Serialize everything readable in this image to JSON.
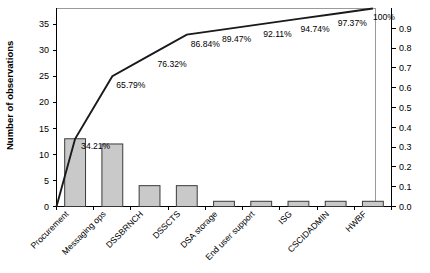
{
  "chart_data": {
    "type": "bar",
    "title": "",
    "subtitle": "",
    "xlabel": "",
    "ylabel": "Number of observations",
    "y2label": "",
    "categories": [
      "Procurement",
      "Messaging ops",
      "DSSBRNCH",
      "DSSCTS",
      "DSA storage",
      "End user support",
      "ISG",
      "CSCIDADMIN",
      "HWBF"
    ],
    "values": [
      13,
      12,
      4,
      4,
      1,
      1,
      1,
      1,
      1
    ],
    "cumulative_percent_labels": [
      "34.21%",
      "65.79%",
      "76.32%",
      "86.84%",
      "89.47%",
      "92.11%",
      "94.74%",
      "97.37%",
      "100%"
    ],
    "cumulative_percent_values": [
      34.21,
      65.79,
      76.32,
      86.84,
      89.47,
      92.11,
      94.74,
      97.37,
      100
    ],
    "total_observations": 38,
    "ylim": [
      0,
      38
    ],
    "y2lim": [
      0,
      1.0
    ],
    "yticks": [
      "0",
      "5",
      "10",
      "15",
      "20",
      "25",
      "30",
      "35"
    ],
    "ytick_values": [
      0,
      5,
      10,
      15,
      20,
      25,
      30,
      35
    ],
    "y2ticks": [
      "0.0",
      "0.1",
      "0.2",
      "0.3",
      "0.4",
      "0.5",
      "0.6",
      "0.7",
      "0.8",
      "0.9"
    ],
    "y2tick_values": [
      0.0,
      0.1,
      0.2,
      0.3,
      0.4,
      0.5,
      0.6,
      0.7,
      0.8,
      0.9
    ],
    "grid": false,
    "legend": false,
    "legend_position": "none",
    "series": [
      {
        "name": "Number of observations",
        "type": "bar",
        "values": [
          13,
          12,
          4,
          4,
          1,
          1,
          1,
          1,
          1
        ]
      },
      {
        "name": "Cumulative %",
        "type": "line",
        "values": [
          34.21,
          65.79,
          76.32,
          86.84,
          89.47,
          92.11,
          94.74,
          97.37,
          100
        ]
      }
    ],
    "colors": {
      "bar_fill": "#c9c9c9",
      "bar_stroke": "#3a3a3a",
      "line": "#1a1a1a",
      "axis": "#000000",
      "frame": "#9a9a9a",
      "background": "#ffffff"
    },
    "category_label_rotation_deg": -45
  }
}
